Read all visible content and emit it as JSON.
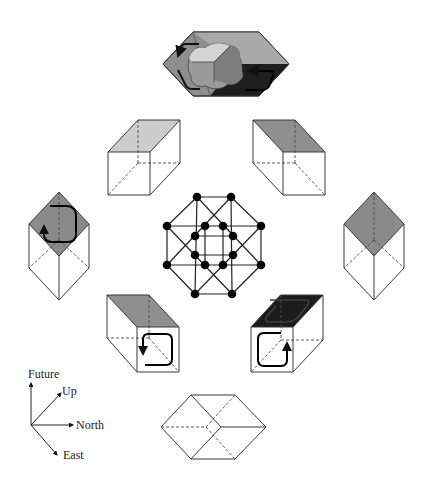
{
  "figure": {
    "colors": {
      "light_face": "#c9c9c9",
      "mid_face": "#8a8a8a",
      "dark_face": "#1c1c1c",
      "edge": "#3a3a3a",
      "node": "#000000"
    },
    "axes_legend": {
      "future": "Future",
      "up": "Up",
      "north": "North",
      "east": "East"
    },
    "panels": [
      {
        "id": "top",
        "label": "hexagonal view with blob and circulation arrows"
      },
      {
        "id": "upper-left-cube",
        "shaded": "top face light"
      },
      {
        "id": "upper-right-cube",
        "shaded": "top face mid"
      },
      {
        "id": "left-cube",
        "shaded": "top face mid with loop arrow"
      },
      {
        "id": "right-cube",
        "shaded": "top face mid"
      },
      {
        "id": "lower-left-cube",
        "shaded": "top face mid, front loop arrow"
      },
      {
        "id": "lower-right-cube",
        "shaded": "top face dark, front loop arrow"
      },
      {
        "id": "bottom-hexagon",
        "shaded": "none"
      }
    ],
    "tesseract": {
      "node_count": 16
    }
  }
}
